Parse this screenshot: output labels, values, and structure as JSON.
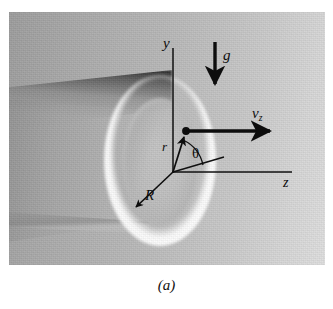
{
  "figure": {
    "caption": "(a)",
    "type": "physics-diagram-photograph",
    "background_color": "#b4b4b4",
    "ink_color": "#0d0d0d",
    "ring_color": "#ffffff"
  },
  "labels": {
    "y_axis": "y",
    "z_axis": "z",
    "gravity": "g",
    "velocity_symbol": "v",
    "velocity_subscript": "z",
    "radial_coordinate": "r",
    "angle": "θ",
    "tube_radius": "R"
  },
  "geometry": {
    "origin": {
      "x": 173,
      "y": 172
    },
    "particle": {
      "x": 186,
      "y": 131
    },
    "y_axis_top": {
      "x": 173,
      "y": 48
    },
    "z_axis_end": {
      "x": 292,
      "y": 172
    },
    "velocity_arrow_end": {
      "x": 276,
      "y": 131
    },
    "gravity_arrow": {
      "x": 215,
      "top_y": 42,
      "bottom_y": 90
    },
    "theta_ray_end": {
      "x": 222,
      "y": 158
    },
    "radius_arrow_end": {
      "x": 131,
      "y": 211
    },
    "ring_center": {
      "x": 151,
      "y": 149
    },
    "ring_outer_rx": 56,
    "ring_outer_ry": 86
  }
}
